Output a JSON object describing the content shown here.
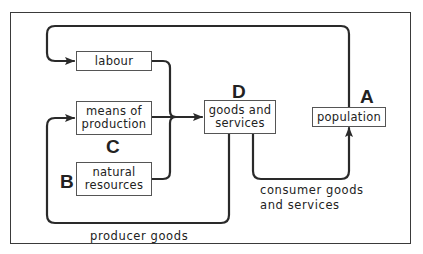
{
  "diagram": {
    "type": "economic-flow",
    "nodes": {
      "labour": {
        "label": "labour"
      },
      "means_of_production": {
        "label": "means of\nproduction",
        "letter": "C"
      },
      "natural_resources": {
        "label": "natural\nresources",
        "letter": "B"
      },
      "goods_and_services": {
        "label": "goods and\nservices",
        "letter": "D"
      },
      "population": {
        "label": "population",
        "letter": "A"
      }
    },
    "edges": [
      {
        "from": "population",
        "to": "labour"
      },
      {
        "from": "labour",
        "to": "goods_and_services"
      },
      {
        "from": "means_of_production",
        "to": "goods_and_services"
      },
      {
        "from": "natural_resources",
        "to": "goods_and_services"
      },
      {
        "from": "goods_and_services",
        "to": "population",
        "label": "consumer goods\nand services"
      },
      {
        "from": "goods_and_services",
        "to": "means_of_production",
        "label": "producer goods"
      }
    ],
    "captions": {
      "consumer": "consumer goods\nand services",
      "producer": "producer goods"
    },
    "colors": {
      "line": "#2a2a2a",
      "box_border": "#555555",
      "background": "#ffffff"
    }
  }
}
